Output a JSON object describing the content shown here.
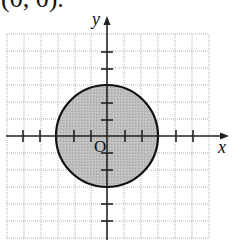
{
  "caption": "(0, 0).",
  "diagram": {
    "type": "coordinate-plane-circle",
    "x_axis_label": "x",
    "y_axis_label": "y",
    "origin_label": "O",
    "circle": {
      "center": [
        0,
        0
      ],
      "radius": 3,
      "shaded": true
    },
    "grid": {
      "x_range": [
        -6,
        6
      ],
      "y_range": [
        -6,
        6
      ],
      "unit_px": 17
    },
    "colors": {
      "fill": "#b8b8b8",
      "stroke": "#111111",
      "grid": "#9a9a9a",
      "axis": "#222222"
    }
  }
}
